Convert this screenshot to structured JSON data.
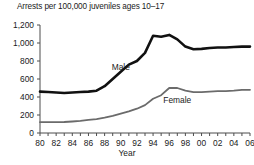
{
  "chart_data": {
    "type": "line",
    "title": "Arrests per 100,000 juveniles ages 10–17",
    "xlabel": "Year",
    "ylabel": "",
    "ylim": [
      0,
      1200
    ],
    "yticks": [
      0,
      200,
      400,
      600,
      800,
      1000,
      1200
    ],
    "ytick_labels": [
      "0",
      "200",
      "400",
      "600",
      "800",
      "1,000",
      "1,200"
    ],
    "xlim": [
      1980,
      2006
    ],
    "xticks": [
      1980,
      1982,
      1984,
      1986,
      1988,
      1990,
      1992,
      1994,
      1996,
      1998,
      2000,
      2002,
      2004,
      2006
    ],
    "xtick_labels": [
      "80",
      "82",
      "84",
      "86",
      "88",
      "90",
      "92",
      "94",
      "96",
      "98",
      "00",
      "02",
      "04",
      "06"
    ],
    "minor_xticks_every": 1,
    "grid": false,
    "legend": "inline-labels",
    "x": [
      1980,
      1981,
      1982,
      1983,
      1984,
      1985,
      1986,
      1987,
      1988,
      1989,
      1990,
      1991,
      1992,
      1993,
      1994,
      1995,
      1996,
      1997,
      1998,
      1999,
      2000,
      2001,
      2002,
      2003,
      2004,
      2005,
      2006
    ],
    "series": [
      {
        "name": "Male",
        "color": "#111111",
        "linewidth": 2.6,
        "label_x": 1990,
        "label_y": 700,
        "values": [
          460,
          455,
          450,
          445,
          450,
          455,
          460,
          470,
          520,
          600,
          680,
          760,
          800,
          890,
          1080,
          1070,
          1090,
          1040,
          960,
          930,
          935,
          945,
          950,
          950,
          955,
          960,
          960
        ]
      },
      {
        "name": "Female",
        "color": "#6b6b6b",
        "linewidth": 1.8,
        "label_x": 1997,
        "label_y": 330,
        "values": [
          120,
          120,
          120,
          122,
          128,
          135,
          145,
          155,
          170,
          190,
          215,
          240,
          270,
          310,
          380,
          420,
          500,
          500,
          470,
          455,
          455,
          460,
          465,
          465,
          470,
          480,
          480
        ]
      }
    ]
  }
}
